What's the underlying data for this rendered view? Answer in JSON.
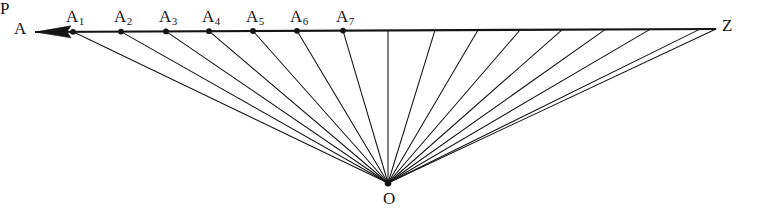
{
  "figure": {
    "type": "geometric-ray-diagram",
    "title": "",
    "background_color": "#ffffff",
    "stroke_color": "#141414",
    "canvas": {
      "width": 766,
      "height": 215
    },
    "baseline": {
      "name": "horizontal-baseline",
      "start": {
        "x": 35,
        "y": 32
      },
      "end": {
        "x": 716,
        "y": 29
      },
      "stroke_width": 2.1,
      "arrowhead": {
        "at": "start",
        "direction": "left",
        "length": 36,
        "half_width": 6
      }
    },
    "vertex": {
      "label": "O",
      "x": 388,
      "y": 183,
      "dot_radius": 3.4,
      "label_offset": {
        "x": 0,
        "y": 21
      }
    },
    "labels": {
      "left_end": "A",
      "apex": "O",
      "right_end": "Z",
      "foot": "P",
      "a1": "A",
      "a1_sub": "1",
      "a2": "A",
      "a2_sub": "2",
      "a3": "A",
      "a3_sub": "3",
      "a4": "A",
      "a4_sub": "4",
      "a5": "A",
      "a5_sub": "5",
      "a6": "A",
      "a6_sub": "6",
      "a7": "A",
      "a7_sub": "7"
    },
    "left_end_label_pos": {
      "x": 14,
      "y": 20
    },
    "right_end_label_pos": {
      "x": 722,
      "y": 17
    },
    "points": [
      {
        "id": "a1",
        "label": "A1",
        "x": 73,
        "y": 31.8,
        "dot": true,
        "label_x": 66,
        "label_y": 8
      },
      {
        "id": "a2",
        "label": "A2",
        "x": 121,
        "y": 31.6,
        "dot": true,
        "label_x": 114,
        "label_y": 8
      },
      {
        "id": "a3",
        "label": "A3",
        "x": 166,
        "y": 31.4,
        "dot": true,
        "label_x": 159,
        "label_y": 8
      },
      {
        "id": "a4",
        "label": "A4",
        "x": 209,
        "y": 31.2,
        "dot": true,
        "label_x": 202,
        "label_y": 8
      },
      {
        "id": "a5",
        "label": "A5",
        "x": 253,
        "y": 31.0,
        "dot": true,
        "label_x": 246,
        "label_y": 8
      },
      {
        "id": "a6",
        "label": "A6",
        "x": 297,
        "y": 30.8,
        "dot": true,
        "label_x": 290,
        "label_y": 8
      },
      {
        "id": "a7",
        "label": "A7",
        "x": 343,
        "y": 30.6,
        "dot": true,
        "label_x": 336,
        "label_y": 8
      },
      {
        "id": "p",
        "label": "P",
        "x": 388,
        "y": 30.4,
        "dot": false,
        "label_x": 382,
        "label_y": 8
      },
      {
        "id": "r1",
        "label": "",
        "x": 435,
        "y": 30.2,
        "dot": false
      },
      {
        "id": "r2",
        "label": "",
        "x": 478,
        "y": 30.1,
        "dot": false
      },
      {
        "id": "r3",
        "label": "",
        "x": 520,
        "y": 30.0,
        "dot": false
      },
      {
        "id": "r4",
        "label": "",
        "x": 562,
        "y": 29.8,
        "dot": false
      },
      {
        "id": "r5",
        "label": "",
        "x": 605,
        "y": 29.6,
        "dot": false
      },
      {
        "id": "r6",
        "label": "",
        "x": 650,
        "y": 29.4,
        "dot": false
      },
      {
        "id": "r7",
        "label": "",
        "x": 700,
        "y": 29.1,
        "dot": false
      },
      {
        "id": "z",
        "label": "Z",
        "x": 716,
        "y": 29.0,
        "dot": false
      }
    ],
    "rays_note": "Every marked point on the baseline is joined by a straight ray to the vertex O."
  }
}
